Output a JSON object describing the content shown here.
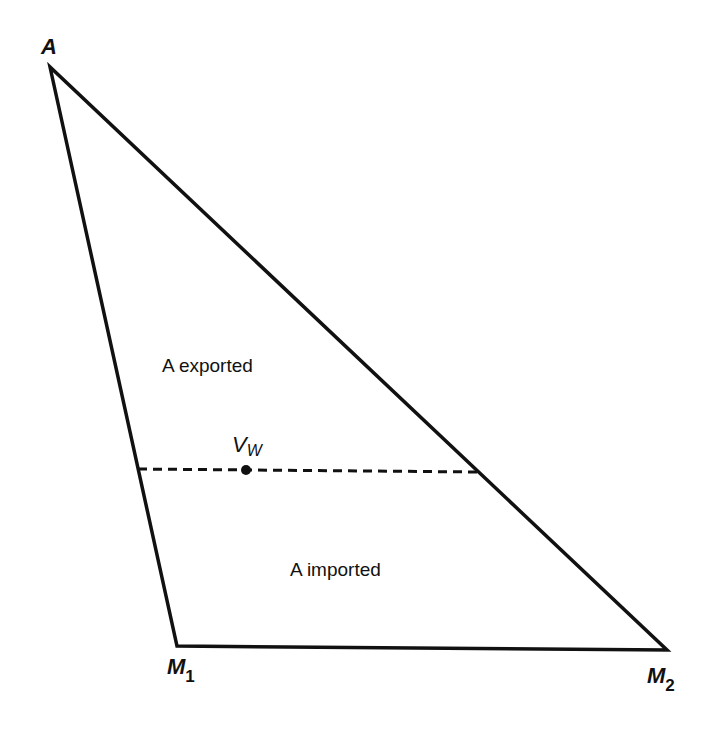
{
  "diagram": {
    "type": "triangle-diagram",
    "vertices": {
      "A": {
        "label": "A",
        "x": 50,
        "y": 67
      },
      "M1": {
        "label": "M",
        "subscript": "1",
        "x": 177,
        "y": 646
      },
      "M2": {
        "label": "M",
        "subscript": "2",
        "x": 667,
        "y": 650
      }
    },
    "regions": {
      "upper": "A exported",
      "lower": "A imported"
    },
    "point": {
      "label": "V",
      "subscript": "W",
      "x": 246,
      "y": 470
    },
    "dashed_line": {
      "x1": 138,
      "y1": 469,
      "x2": 480,
      "y2": 472
    },
    "colors": {
      "line": "#111111",
      "background": "#ffffff"
    }
  }
}
